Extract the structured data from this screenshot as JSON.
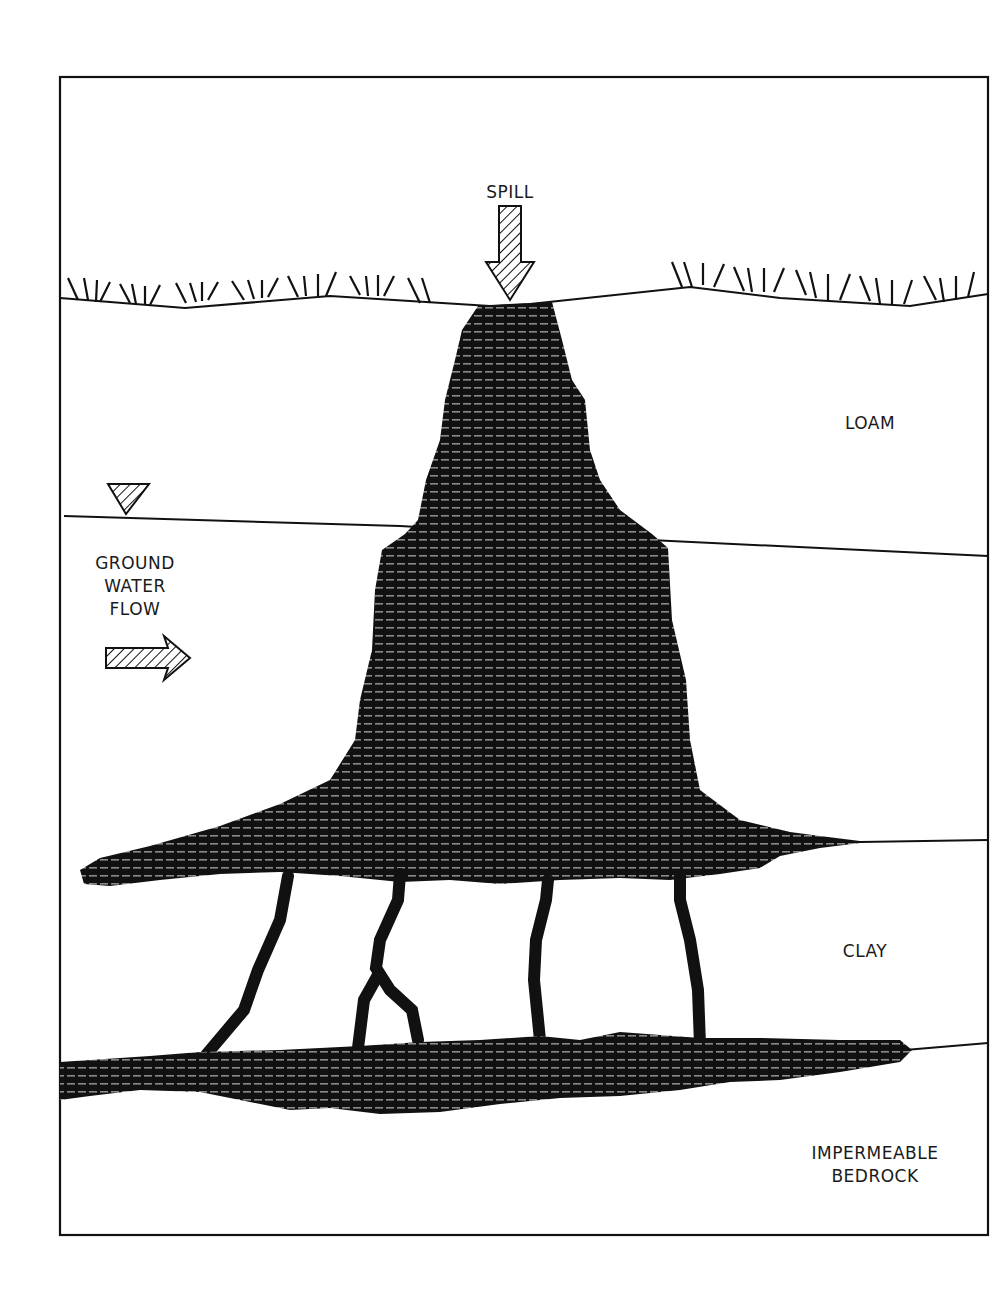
{
  "diagram": {
    "type": "geologic cross-section",
    "labels": {
      "spill": "SPILL",
      "loam": "LOAM",
      "ground_water_flow": [
        "GROUND",
        "WATER",
        "FLOW"
      ],
      "clay": "CLAY",
      "bedrock": [
        "IMPERMEABLE",
        "BEDROCK"
      ]
    },
    "symbols": {
      "spill_arrow": "hatched-down-arrow",
      "water_table": "hatched-inverted-triangle",
      "flow_arrow": "hatched-right-arrow"
    },
    "layers": [
      {
        "name": "ground-surface",
        "marker": "grass tufts"
      },
      {
        "name": "loam",
        "label": "LOAM"
      },
      {
        "name": "water-table",
        "marker": "inverted triangle"
      },
      {
        "name": "clay",
        "label": "CLAY"
      },
      {
        "name": "impermeable-bedrock",
        "label": "IMPERMEABLE BEDROCK"
      }
    ],
    "plume": {
      "shape": "vertical column widening below water table, spreading laterally on clay",
      "fingers_through_clay": 5,
      "fill": "#111111"
    },
    "colors": {
      "ink": "#111111",
      "background": "#ffffff"
    }
  }
}
